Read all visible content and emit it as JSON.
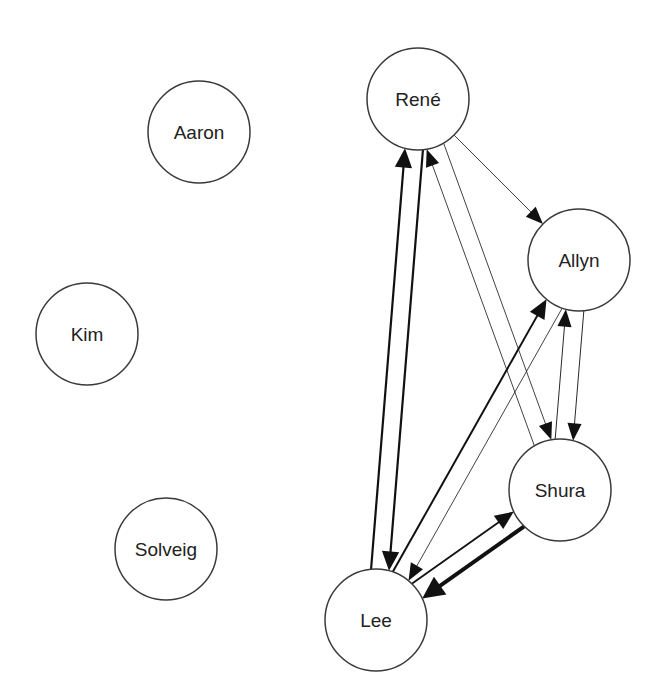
{
  "diagram": {
    "type": "directed-graph",
    "node_radius": 51,
    "colors": {
      "background": "#ffffff",
      "node_stroke": "#3a3a3a",
      "node_fill": "#ffffff",
      "edge": "#111111",
      "label": "#222222"
    },
    "nodes": [
      {
        "id": "rene",
        "label": "René",
        "x": 418,
        "y": 99
      },
      {
        "id": "aaron",
        "label": "Aaron",
        "x": 199,
        "y": 132
      },
      {
        "id": "allyn",
        "label": "Allyn",
        "x": 579,
        "y": 260
      },
      {
        "id": "kim",
        "label": "Kim",
        "x": 87,
        "y": 334
      },
      {
        "id": "shura",
        "label": "Shura",
        "x": 560,
        "y": 490
      },
      {
        "id": "solveig",
        "label": "Solveig",
        "x": 166,
        "y": 549
      },
      {
        "id": "lee",
        "label": "Lee",
        "x": 376,
        "y": 620
      }
    ],
    "edges": [
      {
        "from": "rene",
        "to": "lee",
        "weight": 2.2,
        "offset": -9
      },
      {
        "from": "lee",
        "to": "rene",
        "weight": 2.2,
        "offset": -9
      },
      {
        "from": "rene",
        "to": "allyn",
        "weight": 0.8,
        "offset": 0
      },
      {
        "from": "rene",
        "to": "shura",
        "weight": 0.8,
        "offset": -9
      },
      {
        "from": "shura",
        "to": "rene",
        "weight": 0.8,
        "offset": -9
      },
      {
        "from": "lee",
        "to": "allyn",
        "weight": 2.0,
        "offset": -9
      },
      {
        "from": "allyn",
        "to": "lee",
        "weight": 0.8,
        "offset": -9
      },
      {
        "from": "shura",
        "to": "allyn",
        "weight": 0.9,
        "offset": -9
      },
      {
        "from": "allyn",
        "to": "shura",
        "weight": 0.9,
        "offset": -9
      },
      {
        "from": "lee",
        "to": "shura",
        "weight": 1.8,
        "offset": -9
      },
      {
        "from": "shura",
        "to": "lee",
        "weight": 4.0,
        "offset": -9
      }
    ]
  }
}
